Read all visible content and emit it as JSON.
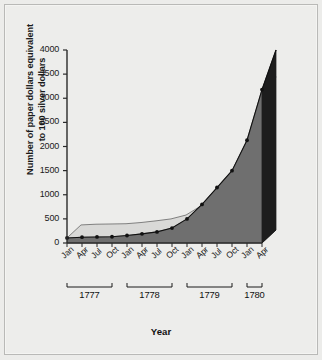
{
  "figure": {
    "background_color": "#ededeb",
    "border_color": "#b9b9b7"
  },
  "axes": {
    "y_title_line1": "Number of paper dollars equivalent",
    "y_title_line2": "to 100 silver dollars",
    "x_title": "Year",
    "y_ticks": [
      "0",
      "500",
      "1000",
      "1500",
      "2000",
      "2500",
      "3000",
      "3500",
      "4000"
    ],
    "month_labels": [
      "Jan",
      "Apr",
      "Jul",
      "Oct",
      "Jan",
      "Apr",
      "Jul",
      "Oct",
      "Jan",
      "Apr",
      "Jul",
      "Oct",
      "Jan",
      "Apr"
    ],
    "year_groups": [
      {
        "label": "1777",
        "count": 4
      },
      {
        "label": "1778",
        "count": 4
      },
      {
        "label": "1779",
        "count": 4
      },
      {
        "label": "1780",
        "count": 2
      }
    ]
  },
  "style": {
    "area_fill_front": "#6f6f6f",
    "area_fill_top": "#d9d9d7",
    "area_fill_side": "#1d1d1d",
    "line_color": "#111111",
    "marker_color": "#111111",
    "axis_color": "#2a2a2a",
    "floor_color": "#c8c8c6"
  },
  "chart_data": {
    "type": "area",
    "title": "",
    "xlabel": "Year",
    "ylabel": "Number of paper dollars equivalent to 100 silver dollars",
    "ylim": [
      0,
      4000
    ],
    "ytick_step": 500,
    "grid": false,
    "legend": null,
    "style_note": "3D extruded area chart with point markers",
    "categories": [
      "Jan 1777",
      "Apr 1777",
      "Jul 1777",
      "Oct 1777",
      "Jan 1778",
      "Apr 1778",
      "Jul 1778",
      "Oct 1778",
      "Jan 1779",
      "Apr 1779",
      "Jul 1779",
      "Oct 1779",
      "Jan 1780",
      "Apr 1780"
    ],
    "values": [
      105,
      120,
      125,
      130,
      155,
      190,
      230,
      310,
      500,
      800,
      1150,
      1500,
      2130,
      3180
    ],
    "values_note": "final plotted vertex reaches 4000 at the right edge (Apr 1780 extrusion top)",
    "series": [
      {
        "name": "Paper dollars per 100 silver dollars",
        "values": [
          105,
          120,
          125,
          130,
          155,
          190,
          230,
          310,
          500,
          800,
          1150,
          1500,
          2130,
          3180
        ]
      }
    ]
  }
}
